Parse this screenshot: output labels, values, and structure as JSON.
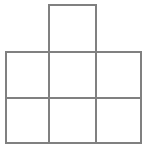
{
  "figure": {
    "background_color": "#ffffff",
    "stroke_color": "#808080",
    "stroke_width": 1.4,
    "canvas": {
      "width": 147,
      "height": 148
    },
    "grid": {
      "x_lines": [
        6,
        49,
        96,
        141
      ],
      "y_lines": [
        5,
        52,
        98,
        143
      ],
      "columns": 3,
      "rows": 2,
      "extra_square_column_index": 1
    },
    "cells": [
      {
        "name": "top-tab-square",
        "x": 49,
        "y": 5,
        "w": 47,
        "h": 47
      },
      {
        "name": "upper-left-square",
        "x": 6,
        "y": 52,
        "w": 43,
        "h": 46
      },
      {
        "name": "upper-mid-square",
        "x": 49,
        "y": 52,
        "w": 47,
        "h": 46
      },
      {
        "name": "upper-right-square",
        "x": 96,
        "y": 52,
        "w": 45,
        "h": 46
      },
      {
        "name": "lower-left-square",
        "x": 6,
        "y": 98,
        "w": 43,
        "h": 45
      },
      {
        "name": "lower-mid-square",
        "x": 49,
        "y": 98,
        "w": 47,
        "h": 45
      },
      {
        "name": "lower-right-square",
        "x": 96,
        "y": 98,
        "w": 45,
        "h": 45
      }
    ],
    "edges": [
      {
        "name": "top-tab-top-edge",
        "x1": 49,
        "y1": 5,
        "x2": 96,
        "y2": 5
      },
      {
        "name": "top-tab-left-edge",
        "x1": 49,
        "y1": 5,
        "x2": 49,
        "y2": 52
      },
      {
        "name": "top-tab-right-edge",
        "x1": 96,
        "y1": 5,
        "x2": 96,
        "y2": 52
      },
      {
        "name": "block-top-edge",
        "x1": 6,
        "y1": 52,
        "x2": 141,
        "y2": 52
      },
      {
        "name": "block-middle-edge",
        "x1": 6,
        "y1": 98,
        "x2": 141,
        "y2": 98
      },
      {
        "name": "block-bottom-edge",
        "x1": 6,
        "y1": 143,
        "x2": 141,
        "y2": 143
      },
      {
        "name": "block-left-edge",
        "x1": 6,
        "y1": 52,
        "x2": 6,
        "y2": 143
      },
      {
        "name": "block-inner-left-edge",
        "x1": 49,
        "y1": 52,
        "x2": 49,
        "y2": 143
      },
      {
        "name": "block-inner-right-edge",
        "x1": 96,
        "y1": 52,
        "x2": 96,
        "y2": 143
      },
      {
        "name": "block-right-edge",
        "x1": 141,
        "y1": 52,
        "x2": 141,
        "y2": 143
      }
    ]
  }
}
